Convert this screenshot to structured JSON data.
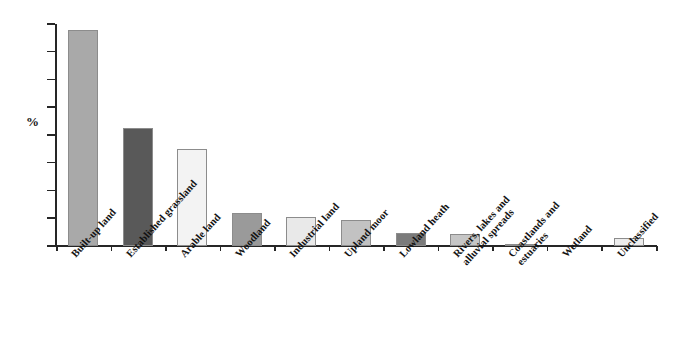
{
  "chart_data": {
    "type": "bar",
    "title": "",
    "subtitle": "",
    "xlabel": "",
    "ylabel": "%",
    "ylim": [
      0,
      40
    ],
    "yticks": [
      0,
      5,
      10,
      15,
      20,
      25,
      30,
      35,
      40
    ],
    "ytick_labels": [
      "0",
      "5",
      "10",
      "15",
      "20",
      "25",
      "30",
      "35",
      "40"
    ],
    "grid": false,
    "legend": false,
    "legend_position": "none",
    "categories": [
      "Built-up land",
      "Established grassland",
      "Arable land",
      "Woodland",
      "Industrial land",
      "Upland moor",
      "Lowland heath",
      "Rivers, lakes and alluvial spreads",
      "Coastlands and estuaries",
      "Wetland",
      "Unclassified"
    ],
    "category_lines": [
      [
        "Built-up land"
      ],
      [
        "Established grassland"
      ],
      [
        "Arable land"
      ],
      [
        "Woodland"
      ],
      [
        "Industrial land"
      ],
      [
        "Upland moor"
      ],
      [
        "Lowland heath"
      ],
      [
        "Rivers, lakes and",
        "alluvial spreads"
      ],
      [
        "Coastlands and",
        "estuaries"
      ],
      [
        "Wetland"
      ],
      [
        "Unclassified"
      ]
    ],
    "values": [
      39.0,
      21.2,
      17.5,
      5.9,
      5.3,
      4.6,
      2.4,
      2.2,
      0.3,
      0.0,
      1.4
    ],
    "bar_colors": [
      "#a9a9a9",
      "#595959",
      "#f3f3f3",
      "#9a9a9a",
      "#e9e9e9",
      "#c2c2c2",
      "#7b7b7b",
      "#c6c6c6",
      "#b5b5b5",
      "#ffffff",
      "#ededed"
    ],
    "bar_border_color": "#8c8c8c",
    "axis_color": "#262626",
    "background_color": "#ffffff"
  }
}
